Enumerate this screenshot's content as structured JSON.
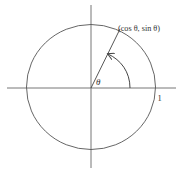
{
  "diagram": {
    "colors": {
      "stroke": "#555555",
      "text": "#333333",
      "background": "#ffffff"
    },
    "point_label": "(cos θ, sin θ)",
    "angle_label": "θ",
    "radius_label": "1",
    "elements": {
      "circle": {
        "cx": 91,
        "cy": 88,
        "rx": 64.5,
        "ry": 62.5
      },
      "x_axis": {
        "x1": 7,
        "y1": 88,
        "x2": 176,
        "y2": 88
      },
      "y_axis": {
        "x1": 91,
        "y1": 5,
        "x2": 91,
        "y2": 168
      },
      "radius_line": {
        "x1": 91,
        "y1": 88,
        "x2": 120,
        "y2": 29
      },
      "angle_arc": {
        "from": [
          130,
          88
        ],
        "to": [
          108,
          54
        ]
      }
    }
  }
}
